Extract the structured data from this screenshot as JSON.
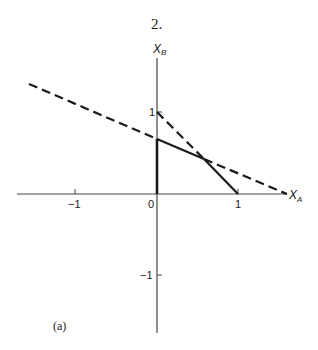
{
  "figure": {
    "number_label": "2.",
    "panel_label": "(a)",
    "x_axis_label": "X",
    "x_axis_sub": "A",
    "y_axis_label": "X",
    "y_axis_sub": "B",
    "x_ticks": [
      {
        "value": -1,
        "label": "−1"
      },
      {
        "value": 0,
        "label": "0"
      },
      {
        "value": 1,
        "label": "1"
      }
    ],
    "y_ticks": [
      {
        "value": 1,
        "label": "1"
      },
      {
        "value": -1,
        "label": "−1"
      }
    ]
  },
  "diagram": {
    "origin_px": [
      157,
      194
    ],
    "unit_px": 81.5,
    "lines": [
      {
        "name": "line-xa-plus-xb-eq-1",
        "from": [
          0,
          1
        ],
        "to": [
          1,
          0
        ],
        "style": "dashed above intersection, solid below"
      },
      {
        "name": "shallow-line",
        "from": [
          -1.58,
          1.35
        ],
        "to": [
          1.6,
          0
        ],
        "style": "solid between x=0 and intersection, dashed elsewhere"
      },
      {
        "name": "vertical-segment",
        "from": [
          0,
          0
        ],
        "to": [
          0,
          0.68
        ],
        "style": "solid thick"
      }
    ],
    "intersection": [
      0.58,
      0.42
    ],
    "colors": {
      "ink": "#1a1a1a",
      "axis": "#444444"
    }
  }
}
